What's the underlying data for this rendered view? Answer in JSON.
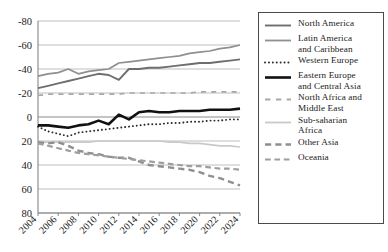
{
  "chart_data": {
    "type": "line",
    "title": "",
    "xlabel": "",
    "ylabel": "",
    "x": [
      2004,
      2005,
      2006,
      2007,
      2008,
      2009,
      2010,
      2011,
      2012,
      2013,
      2014,
      2015,
      2016,
      2017,
      2018,
      2019,
      2020,
      2021,
      2022,
      2023,
      2024
    ],
    "xlim": [
      2004,
      2024
    ],
    "ylim": [
      -80,
      80
    ],
    "yticks": [
      -80,
      -60,
      -40,
      -20,
      0,
      20,
      40,
      60,
      80
    ],
    "xticks": [
      2004,
      2006,
      2008,
      2010,
      2012,
      2014,
      2016,
      2018,
      2020,
      2022,
      2024
    ],
    "xtick_labels": [
      "2004",
      "2006",
      "2008",
      "2010",
      "2012",
      "2014",
      "2016",
      "2018",
      "2020",
      "2022",
      "2024"
    ],
    "ytick_labels": [
      "80",
      "60",
      "40",
      "20",
      "0",
      "-20",
      "-40",
      "-60",
      "-80"
    ],
    "grid": "horizontal",
    "legend_position": "right",
    "series": [
      {
        "name": "North America",
        "color": "#6e6e6e",
        "style": "solid",
        "width": 1.9,
        "values": [
          24,
          26,
          28,
          30,
          32,
          34,
          36,
          35,
          31,
          40,
          40,
          41,
          41,
          42,
          43,
          44,
          45,
          45,
          46,
          47,
          48
        ]
      },
      {
        "name": "Latin America and Caribbean",
        "color": "#8f8f8f",
        "style": "solid",
        "width": 1.7,
        "values": [
          34,
          36,
          37,
          40,
          36,
          38,
          39,
          40,
          45,
          46,
          47,
          48,
          49,
          50,
          51,
          53,
          54,
          55,
          57,
          58,
          60
        ]
      },
      {
        "name": "Western Europe",
        "color": "#2b2b2b",
        "style": "dotted",
        "width": 1.9,
        "values": [
          -8,
          -12,
          -14,
          -16,
          -13,
          -12,
          -11,
          -10,
          -9,
          -8,
          -7,
          -6,
          -6,
          -5,
          -5,
          -4,
          -4,
          -3,
          -3,
          -2,
          -2
        ]
      },
      {
        "name": "Eastern Europe and Central Asia",
        "color": "#111111",
        "style": "solid",
        "width": 2.6,
        "values": [
          -7,
          -7,
          -8,
          -9,
          -7,
          -6,
          -3,
          -6,
          2,
          -2,
          4,
          5,
          4,
          4,
          5,
          5,
          5,
          6,
          6,
          6,
          7
        ]
      },
      {
        "name": "North Africa and Middle East",
        "color": "#a8a8a8",
        "style": "dashdot",
        "width": 1.7,
        "values": [
          18,
          19,
          19,
          19,
          19,
          19,
          19,
          19,
          19,
          20,
          20,
          20,
          20,
          20,
          20,
          20,
          21,
          21,
          21,
          21,
          21
        ]
      },
      {
        "name": "Sub-saharian Africa",
        "color": "#c9c9c9",
        "style": "solid",
        "width": 1.7,
        "values": [
          -21,
          -21,
          -21,
          -21,
          -21,
          -21,
          -20,
          -20,
          -20,
          -20,
          -20,
          -20,
          -20,
          -21,
          -21,
          -22,
          -22,
          -23,
          -24,
          -24,
          -25
        ]
      },
      {
        "name": "Other Asia",
        "color": "#8f8f8f",
        "style": "dashed",
        "width": 2.4,
        "values": [
          -21,
          -22,
          -21,
          -24,
          -28,
          -30,
          -31,
          -33,
          -34,
          -34,
          -37,
          -40,
          -41,
          -42,
          -43,
          -44,
          -46,
          -49,
          -51,
          -54,
          -57
        ]
      },
      {
        "name": "Oceania",
        "color": "#9e9e9e",
        "style": "dashed",
        "width": 2.2,
        "values": [
          -22,
          -24,
          -26,
          -28,
          -30,
          -31,
          -32,
          -33,
          -34,
          -35,
          -36,
          -37,
          -38,
          -39,
          -40,
          -41,
          -41,
          -42,
          -43,
          -43,
          -44
        ]
      }
    ]
  },
  "legend": {
    "items": [
      {
        "label": "North America"
      },
      {
        "label": "Latin America\nand Caribbean"
      },
      {
        "label": "Western Europe"
      },
      {
        "label": "Eastern Europe\nand Central Asia"
      },
      {
        "label": "North Africa and\nMiddle East"
      },
      {
        "label": "Sub-saharian\nAfrica"
      },
      {
        "label": "Other Asia"
      },
      {
        "label": "Oceania"
      }
    ]
  },
  "colors": {
    "axis": "#7a7a7a",
    "grid": "#b8b8b8",
    "text": "#1a1a1a",
    "legend_border": "#4a4a4a"
  }
}
